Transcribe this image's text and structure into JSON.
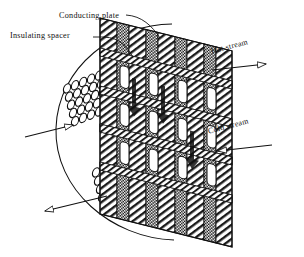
{
  "figure": {
    "background_color": "#ffffff",
    "ink_color": "#111111"
  },
  "labels": {
    "conducting_plate": "Conducting plate",
    "insulating_spacer": "Insulating spacer",
    "hot_stream": "Hot stream",
    "cold_stream": "Cold stream"
  },
  "icons": {
    "hot_arrow": "arrow-right-icon",
    "cold_arrow": "arrow-left-icon",
    "inlet_arrow": "open-arrow-right-icon",
    "outlet_arrow": "open-arrow-left-icon",
    "leader_conducting": "leader-line-icon",
    "leader_insulating": "leader-line-icon",
    "boundary": "ellipse-outline-icon",
    "plate_stack": "hatched-plate-stack-icon",
    "spacer_blocks": "checkered-spacer-icon",
    "tube_bundle_upper": "tube-bundle-icon",
    "tube_bundle_lower": "tube-bundle-icon"
  },
  "geometry": {
    "stack": {
      "columns": 7,
      "rows": 9,
      "skew_deg": -14,
      "plate_fill": "diagonal-hatch",
      "spacer_fill": "checker-dot"
    },
    "tube_bundles": [
      {
        "name": "upper",
        "cols": 5,
        "rows": 5
      },
      {
        "name": "lower",
        "cols": 5,
        "rows": 4
      }
    ]
  }
}
